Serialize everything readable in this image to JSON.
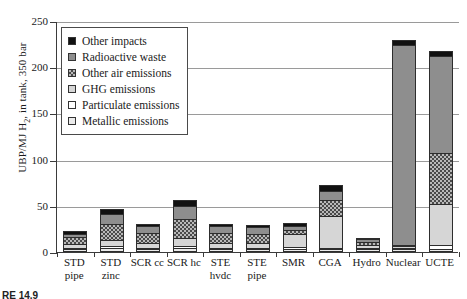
{
  "chart_data": {
    "type": "bar",
    "title": "",
    "xlabel": "",
    "ylabel": "UBP/MJ H2, in tank, 350 bar",
    "ylim": [
      0,
      250
    ],
    "ytick_values": [
      0,
      50,
      100,
      150,
      200,
      250
    ],
    "grid": true,
    "legend_position": "upper-left-inside",
    "stacked": true,
    "categories": [
      "STD pipe",
      "STD zinc",
      "SCR cc",
      "SCR hc",
      "STE hvdc",
      "STE pipe",
      "SMR",
      "CGA",
      "Hydro",
      "Nuclear",
      "UCTE"
    ],
    "series": [
      {
        "name": "Metallic emissions",
        "key": "metal",
        "values": [
          1,
          2,
          1,
          2,
          1,
          1,
          1,
          1,
          0.5,
          0.5,
          1
        ]
      },
      {
        "name": "Particulate emissions",
        "key": "part",
        "values": [
          1,
          2,
          1,
          2,
          1,
          1,
          2,
          1,
          0.5,
          1,
          4
        ]
      },
      {
        "name": "GHG emissions",
        "key": "ghg",
        "values": [
          4,
          7,
          5,
          9,
          5,
          5,
          14,
          34,
          3,
          1,
          45
        ]
      },
      {
        "name": "Other air emissions",
        "key": "air",
        "values": [
          7,
          17,
          11,
          21,
          11,
          10,
          4,
          18,
          3,
          2,
          55
        ]
      },
      {
        "name": "Radioactive waste",
        "key": "radio",
        "values": [
          4,
          11,
          7,
          14,
          7,
          7,
          5,
          9,
          3,
          216,
          105
        ]
      },
      {
        "name": "Other impacts",
        "key": "other",
        "values": [
          3,
          5,
          3,
          6,
          3,
          3,
          3,
          7,
          1,
          5,
          5
        ]
      }
    ],
    "totals": [
      20,
      44,
      28,
      54,
      28,
      27,
      29,
      70,
      11,
      225.5,
      215
    ]
  },
  "legend": {
    "items": [
      {
        "label": "Other impacts",
        "swatch": "solid-black-swatch",
        "color": "#111111"
      },
      {
        "label": "Radioactive waste",
        "swatch": "gray-swatch",
        "color": "#8e8e8e"
      },
      {
        "label": "Other air emissions",
        "swatch": "crosshatch-swatch",
        "color": "#4a4a4a"
      },
      {
        "label": "GHG emissions",
        "swatch": "light-gray-swatch",
        "color": "#d6d6d6"
      },
      {
        "label": "Particulate emissions",
        "swatch": "white-swatch",
        "color": "#ffffff"
      },
      {
        "label": "Metallic emissions",
        "swatch": "very-light-swatch",
        "color": "#ebebeb"
      }
    ]
  },
  "axis": {
    "y_title_main": "UBP/MJ H",
    "y_title_sub": "2",
    "y_title_rest": ", in tank, 350 bar"
  },
  "caption": "RE 14.9"
}
